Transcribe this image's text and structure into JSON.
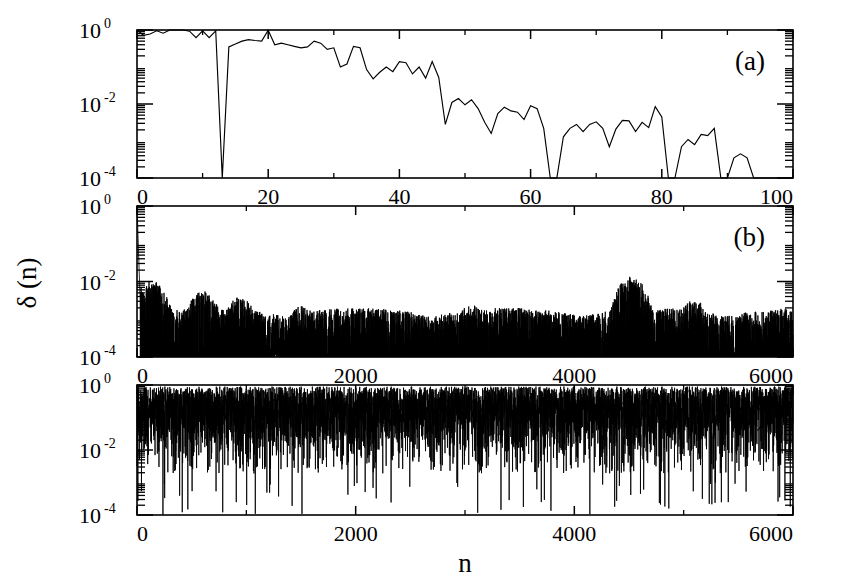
{
  "figure": {
    "background": "#ffffff",
    "ink": "#000000",
    "y_axis_title": "δ (n)",
    "x_axis_title": "n",
    "y_tick_labels": [
      "10",
      "10",
      "10"
    ],
    "y_tick_exponents": [
      "0",
      "-2",
      "-4"
    ]
  },
  "panels": [
    {
      "tag": "(a)",
      "xlabel": "",
      "ylabel": "δ (n)",
      "x_ticks": [
        0,
        20,
        40,
        60,
        80,
        100
      ],
      "x_tick_labels": [
        "0",
        "20",
        "40",
        "60",
        "80",
        "100"
      ],
      "y_ticks": [
        1,
        0.01,
        0.0001
      ],
      "y_tick_labels": [
        "10",
        "10",
        "10"
      ],
      "y_tick_exponents": [
        "0",
        "-2",
        "-4"
      ],
      "xlim": [
        0,
        100
      ],
      "ylim": [
        0.0001,
        1.0
      ],
      "yscale": "log"
    },
    {
      "tag": "(b)",
      "xlabel": "",
      "ylabel": "δ (n)",
      "x_ticks": [
        0,
        2000,
        4000,
        6000
      ],
      "x_tick_labels": [
        "0",
        "2000",
        "4000",
        "6000"
      ],
      "y_ticks": [
        1,
        0.01,
        0.0001
      ],
      "y_tick_labels": [
        "10",
        "10",
        "10"
      ],
      "y_tick_exponents": [
        "0",
        "-2",
        "-4"
      ],
      "xlim": [
        0,
        6000
      ],
      "ylim": [
        0.0001,
        1.0
      ],
      "yscale": "log"
    },
    {
      "tag": "(c)",
      "xlabel": "n",
      "ylabel": "δ (n)",
      "x_ticks": [
        0,
        2000,
        4000,
        6000
      ],
      "x_tick_labels": [
        "0",
        "2000",
        "4000",
        "6000"
      ],
      "y_ticks": [
        1,
        0.01,
        0.0001
      ],
      "y_tick_labels": [
        "10",
        "10",
        "10"
      ],
      "y_tick_exponents": [
        "0",
        "-2",
        "-4"
      ],
      "xlim": [
        0,
        6000
      ],
      "ylim": [
        0.0001,
        1.0
      ],
      "yscale": "log"
    }
  ],
  "chart_data": [
    {
      "type": "line",
      "panel": "(a)",
      "title": "",
      "xlabel": "",
      "ylabel": "δ (n)",
      "xlim": [
        0,
        100
      ],
      "ylim": [
        0.0001,
        1.0
      ],
      "yscale": "log",
      "grid": false,
      "legend": "none",
      "series": [
        {
          "name": "delta(n) panel a",
          "x": [
            0,
            1,
            2,
            3,
            4,
            5,
            6,
            7,
            8,
            9,
            10,
            11,
            12,
            13,
            14,
            15,
            16,
            17,
            18,
            19,
            20,
            21,
            22,
            23,
            24,
            25,
            26,
            27,
            28,
            29,
            30,
            31,
            32,
            33,
            34,
            35,
            36,
            37,
            38,
            39,
            40,
            41,
            42,
            43,
            44,
            45,
            46,
            47,
            48,
            49,
            50,
            51,
            52,
            53,
            54,
            55,
            56,
            57,
            58,
            59,
            60,
            61,
            62,
            63,
            64,
            65,
            66,
            67,
            68,
            69,
            70,
            71,
            72,
            73,
            74,
            75,
            76,
            77,
            78,
            79,
            80,
            81,
            82,
            83,
            84,
            85,
            86,
            87,
            88,
            89,
            90,
            91,
            92,
            93,
            94,
            95,
            96,
            97,
            98,
            99,
            100
          ],
          "values": [
            1.0,
            0.72,
            0.78,
            0.95,
            0.82,
            1.0,
            1.0,
            1.0,
            0.93,
            0.62,
            0.95,
            0.62,
            0.95,
            0.0001,
            0.35,
            0.42,
            0.5,
            0.55,
            0.52,
            0.5,
            0.98,
            0.4,
            0.44,
            0.4,
            0.36,
            0.33,
            0.35,
            0.5,
            0.44,
            0.3,
            0.33,
            0.1,
            0.12,
            0.36,
            0.33,
            0.085,
            0.048,
            0.072,
            0.1,
            0.075,
            0.14,
            0.13,
            0.065,
            0.1,
            0.05,
            0.14,
            0.052,
            0.0028,
            0.011,
            0.014,
            0.0095,
            0.013,
            0.0075,
            0.0032,
            0.0016,
            0.0055,
            0.0082,
            0.0065,
            0.006,
            0.0038,
            0.009,
            0.0075,
            0.0022,
            0.0001,
            0.0001,
            0.0013,
            0.0022,
            0.0028,
            0.0018,
            0.0028,
            0.0033,
            0.0022,
            0.0007,
            0.0021,
            0.0036,
            0.0035,
            0.0018,
            0.0032,
            0.0023,
            0.0085,
            0.0045,
            0.0001,
            0.0001,
            0.0007,
            0.0011,
            0.0008,
            0.0015,
            0.0014,
            0.0022,
            0.0001,
            0.0001,
            0.00035,
            0.00045,
            0.00035,
            0.0001,
            0.0001,
            0.0001,
            0.0001,
            0.0001,
            0.0001,
            0.0001
          ]
        }
      ]
    },
    {
      "type": "line",
      "panel": "(b)",
      "title": "",
      "xlabel": "",
      "ylabel": "δ (n)",
      "xlim": [
        0,
        6000
      ],
      "ylim": [
        0.0001,
        1.0
      ],
      "yscale": "log",
      "grid": false,
      "legend": "none",
      "description": "Dense spiky time series: large spike to 1.0 near n=0, decaying within n<200, then a noisy floor near 1e-4 with intermittent bursts up to ~4e-3; a prominent burst cluster near n=4500 reaching ~1.2e-2 and another near n=5100 reaching ~3e-3.",
      "baseline": 0.0001,
      "noise_top": 0.0025,
      "seed": 20411,
      "markers": [
        {
          "x": 0,
          "y": 1.0
        },
        {
          "x": 120,
          "y": 0.012
        },
        {
          "x": 600,
          "y": 0.0045
        },
        {
          "x": 950,
          "y": 0.0035
        },
        {
          "x": 1500,
          "y": 0.0025
        },
        {
          "x": 3050,
          "y": 0.0022
        },
        {
          "x": 4520,
          "y": 0.012
        },
        {
          "x": 5100,
          "y": 0.0032
        },
        {
          "x": 5450,
          "y": 0.0018
        }
      ]
    },
    {
      "type": "line",
      "panel": "(c)",
      "title": "",
      "xlabel": "n",
      "ylabel": "δ (n)",
      "xlim": [
        0,
        6000
      ],
      "ylim": [
        0.0001,
        1.0
      ],
      "yscale": "log",
      "grid": false,
      "legend": "none",
      "description": "Dense fully-developed chaotic band filling roughly 5e-3 to 1.0 across the whole range, with sparse deep downward excursions reaching 1e-4.",
      "band_low": 0.006,
      "band_high": 0.9,
      "dropout_floor": 0.0001,
      "seed": 91733
    }
  ]
}
